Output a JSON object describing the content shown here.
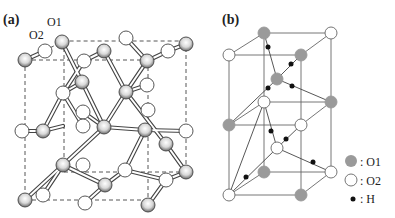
{
  "figure": {
    "panel_a": {
      "label": "(a)",
      "atom_labels": [
        "O1",
        "O2"
      ]
    },
    "panel_b": {
      "label": "(b)"
    },
    "legend": [
      {
        "symbol": "grey-circle",
        "text": ": O1"
      },
      {
        "symbol": "white-circle",
        "text": ": O2"
      },
      {
        "symbol": "black-dot",
        "text": ": H"
      }
    ],
    "colors": {
      "o1_fill": "#9a9a9a",
      "o2_fill": "#ffffff",
      "h_fill": "#111111",
      "line": "#555555"
    }
  }
}
